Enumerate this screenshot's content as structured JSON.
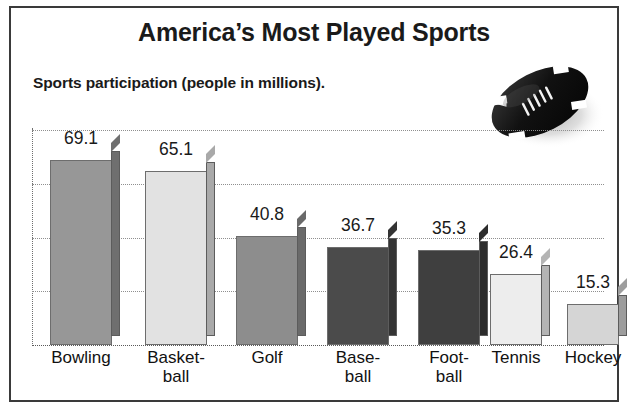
{
  "figure": {
    "title": "America’s Most Played Sports",
    "subtitle": "Sports participation (people in millions).",
    "decoration_icon": "football-icon",
    "border_color": "#3a3a3a",
    "background_color": "#ffffff",
    "text_color": "#1a1a1a"
  },
  "chart_data": {
    "type": "bar",
    "title": "America’s Most Played Sports",
    "subtitle": "Sports participation (people in millions).",
    "xlabel": "",
    "ylabel": "",
    "ylim": [
      0,
      81
    ],
    "grid": true,
    "gridlines": [
      20,
      40,
      60,
      80
    ],
    "legend": null,
    "axis_tick_labels": [],
    "categories": [
      "Bowling",
      "Basketball",
      "Golf",
      "Baseball",
      "Football",
      "Tennis",
      "Hockey"
    ],
    "category_display": [
      [
        "Bowling"
      ],
      [
        "Basket-",
        "ball"
      ],
      [
        "Golf"
      ],
      [
        "Base-",
        "ball"
      ],
      [
        "Foot-",
        "ball"
      ],
      [
        "Tennis"
      ],
      [
        "Hockey"
      ]
    ],
    "values": [
      69.1,
      65.1,
      40.8,
      36.7,
      35.3,
      26.4,
      15.3
    ],
    "value_labels": [
      "69.1",
      "65.1",
      "40.8",
      "36.7",
      "35.3",
      "26.4",
      "15.3"
    ],
    "bar_colors": [
      "#979797",
      "#e2e2e2",
      "#8d8d8d",
      "#4b4b4b",
      "#3f3f3f",
      "#ededed",
      "#d5d5d5"
    ],
    "bar_side_colors": [
      "#6f6f6f",
      "#a9a9a9",
      "#6a6a6a",
      "#343434",
      "#2c2c2c",
      "#b4b4b4",
      "#9d9d9d"
    ],
    "units": "millions of people"
  }
}
